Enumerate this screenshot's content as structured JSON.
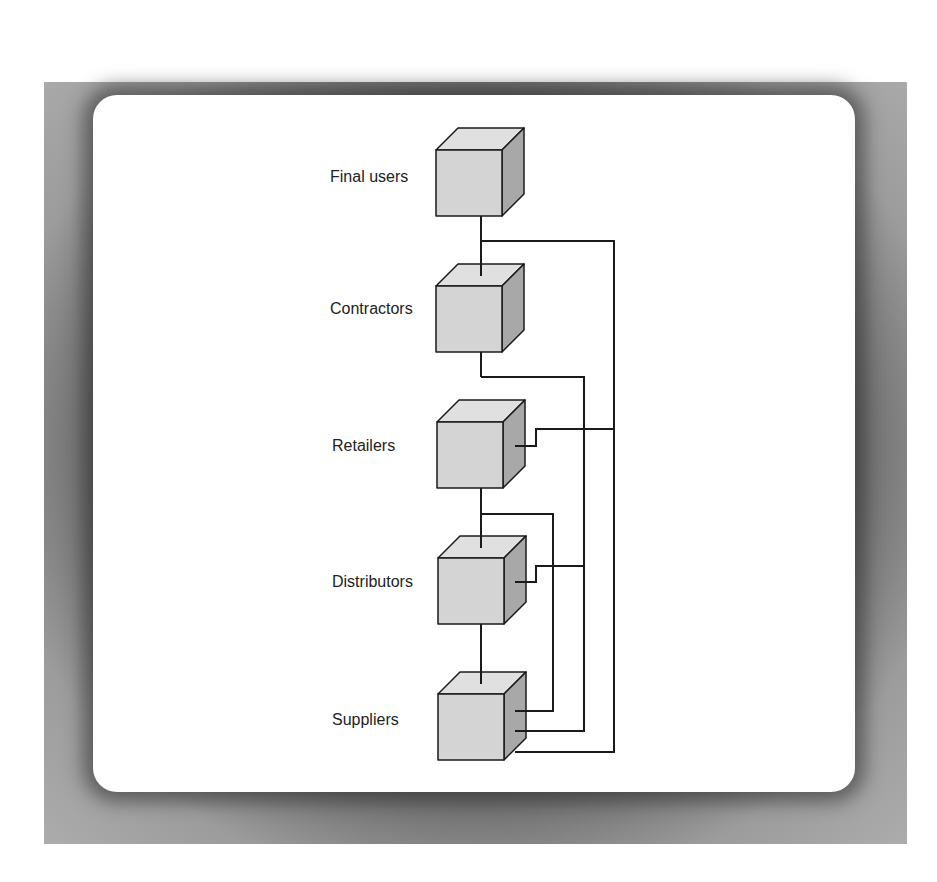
{
  "diagram": {
    "type": "supply-chain-tiers",
    "nodes": [
      {
        "id": "final_users",
        "label": "Final users"
      },
      {
        "id": "contractors",
        "label": "Contractors"
      },
      {
        "id": "retailers",
        "label": "Retailers"
      },
      {
        "id": "distributors",
        "label": "Distributors"
      },
      {
        "id": "suppliers",
        "label": "Suppliers"
      }
    ],
    "edges": [
      {
        "from": "final_users",
        "to": "contractors"
      },
      {
        "from": "final_users",
        "to": "retailers"
      },
      {
        "from": "final_users",
        "to": "suppliers"
      },
      {
        "from": "contractors",
        "to": "distributors"
      },
      {
        "from": "contractors",
        "to": "suppliers"
      },
      {
        "from": "retailers",
        "to": "distributors"
      },
      {
        "from": "retailers",
        "to": "suppliers"
      },
      {
        "from": "distributors",
        "to": "suppliers"
      }
    ]
  },
  "colors": {
    "frame": "#a9a9a9",
    "card": "#ffffff",
    "cube_front": "#d4d4d4",
    "cube_top": "#e0e0e0",
    "cube_side": "#a8a8a8",
    "line": "#1a1a1a"
  }
}
